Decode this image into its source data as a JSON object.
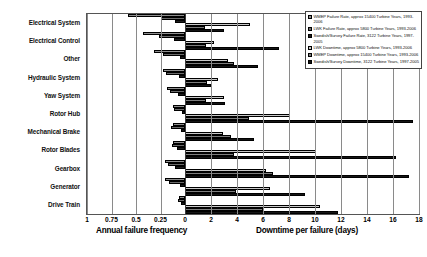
{
  "chart_data": {
    "type": "bar",
    "title": "",
    "orientation": "horizontal-diverging",
    "categories": [
      "Electrical System",
      "Electrical Control",
      "Other",
      "Hydraulic System",
      "Yaw System",
      "Rotor Hub",
      "Mechanical Brake",
      "Rotor Blades",
      "Gearbox",
      "Generator",
      "Drive Train"
    ],
    "left_axis": {
      "label": "Annual failure frequency",
      "ticks": [
        "1",
        "0.75",
        "0.5",
        "0.25",
        "0"
      ],
      "tick_values": [
        1,
        0.75,
        0.5,
        0.25,
        0
      ],
      "range": [
        1,
        0
      ],
      "direction": "reversed"
    },
    "right_axis": {
      "label": "Downtime per failure (days)",
      "ticks": [
        "0",
        "2",
        "4",
        "6",
        "8",
        "10",
        "12",
        "14",
        "16",
        "18"
      ],
      "tick_values": [
        0,
        2,
        4,
        6,
        8,
        10,
        12,
        14,
        16,
        18
      ],
      "range": [
        0,
        18
      ]
    },
    "grid": true,
    "legend_position": "top-right",
    "series": [
      {
        "name": "WMEP Failure Rate, approx 15400 Turbine Years, 1993-2006",
        "short_name": "WMEP Failure Rate",
        "axis": "left",
        "color": "#8f8f8f",
        "values": [
          0.58,
          0.43,
          0.32,
          0.22,
          0.18,
          0.12,
          0.12,
          0.12,
          0.2,
          0.2,
          0.06
        ]
      },
      {
        "name": "LWK Failure Rate, approx 5800 Turbine Years, 1993-2006",
        "short_name": "LWK Failure Rate",
        "axis": "left",
        "color": "#6a6a6a",
        "values": [
          0.25,
          0.27,
          0.22,
          0.19,
          0.15,
          0.11,
          0.14,
          0.13,
          0.17,
          0.16,
          0.07
        ]
      },
      {
        "name": "Swedish/Survey Failure Rate, 3122 Turbine Years, 1997-2005",
        "short_name": "Swedish/Survey Failure Rate",
        "axis": "left",
        "color": "#1c1c1c",
        "values": [
          0.1,
          0.11,
          0.05,
          0.06,
          0.07,
          0.03,
          0.04,
          0.08,
          0.1,
          0.05,
          0.04
        ]
      },
      {
        "name": "LWK Downtime, approx 5800 Turbine Years, 1993-2006",
        "short_name": "LWK Downtime",
        "axis": "right",
        "color": "#c9c9c9",
        "values": [
          5.0,
          2.2,
          3.3,
          2.5,
          3.0,
          8.1,
          2.9,
          10.1,
          6.2,
          6.5,
          10.4
        ]
      },
      {
        "name": "WMEP Downtime, approx 15400 Turbine Years, 1993-2006",
        "short_name": "WMEP Downtime",
        "axis": "right",
        "color": "#7d7d7d",
        "values": [
          1.5,
          1.6,
          3.8,
          1.7,
          1.6,
          4.9,
          3.5,
          3.8,
          6.8,
          3.9,
          6.0
        ]
      },
      {
        "name": "Swedish/Survey Downtime, 3122 Turbine Years, 1997-2005",
        "short_name": "Swedish/Survey Downtime",
        "axis": "right",
        "color": "#141414",
        "values": [
          3.0,
          7.2,
          5.6,
          2.0,
          3.1,
          17.5,
          5.3,
          16.2,
          17.2,
          9.2,
          11.8
        ]
      }
    ]
  }
}
